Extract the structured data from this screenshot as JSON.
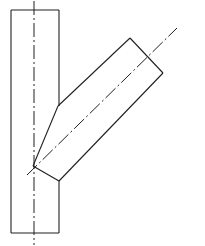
{
  "figure": {
    "type": "technical-line-drawing",
    "canvas": {
      "width": 205,
      "height": 246
    },
    "background_color": "#ffffff",
    "line_color": "#231f20",
    "line_width": 1.1,
    "centerline_color": "#231f20",
    "centerline_width": 1,
    "centerline_dash_pattern": "14,3,2,3"
  },
  "geometry": {
    "main_pipe": {
      "name": "main-run-pipe",
      "shape": "rectangle",
      "left": 11,
      "right": 59,
      "top": 10,
      "bottom": 233,
      "width": 48,
      "height": 223,
      "orientation": "vertical",
      "segments": {
        "left_edge": "M11,10 L11,233",
        "top_edge": "M11,10 L59,10",
        "bottom_edge": "M11,233 L59,233",
        "right_edge_upper": "M59,10 L59,106",
        "right_edge_lower": "M59,181 L59,233"
      }
    },
    "branch_pipe": {
      "name": "branch-lateral-pipe",
      "shape": "parallelogram",
      "orientation": "diagonal-up-right",
      "vertices": [
        {
          "label": "junction-apex",
          "x": 33,
          "y": 166
        },
        {
          "label": "upper-intersection",
          "x": 58,
          "y": 106
        },
        {
          "label": "far-top-corner",
          "x": 130,
          "y": 38
        },
        {
          "label": "far-right-corner",
          "x": 163,
          "y": 73
        },
        {
          "label": "lower-intersection",
          "x": 59,
          "y": 181
        }
      ],
      "outline_path": "M33,166 L58,106 L130,38 L163,73 L59,181 Z",
      "end_face": "M130,38 L163,73"
    },
    "centerlines": [
      {
        "name": "main-pipe-centerline",
        "orientation": "vertical",
        "x": 34,
        "y_start": 1,
        "y_end": 245,
        "path": "M34,1 L34,245"
      },
      {
        "name": "branch-pipe-centerline",
        "orientation": "diagonal",
        "path": "M27,175 L177,28",
        "start": {
          "x": 27,
          "y": 175
        },
        "end": {
          "x": 177,
          "y": 28
        }
      }
    ]
  },
  "labels": {
    "text_items": []
  }
}
